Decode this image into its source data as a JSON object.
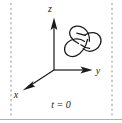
{
  "figure": {
    "kind": "3d-axes-with-knot-diagram",
    "background_color": "#ffffff",
    "stroke_color": "#1a1a1a",
    "dashed_color": "#8c8c8c",
    "baseline_color": "#b0b0b0",
    "axes": {
      "origin": {
        "x": 54,
        "y": 70
      },
      "z": {
        "label": "z",
        "label_pos": {
          "x": 50,
          "y": 12
        },
        "tip": {
          "x": 54,
          "y": 18
        }
      },
      "y": {
        "label": "y",
        "label_pos": {
          "x": 97,
          "y": 74
        },
        "tip": {
          "x": 92,
          "y": 70
        }
      },
      "x": {
        "label": "x",
        "label_pos": {
          "x": 15,
          "y": 97
        },
        "tip": {
          "x": 23,
          "y": 88
        }
      }
    },
    "knot": {
      "name": "trefoil-knot",
      "center": {
        "x": 82,
        "y": 42
      },
      "bbox": {
        "x": 64,
        "y": 24,
        "w": 38,
        "h": 38
      }
    },
    "dashed_lines": [
      {
        "name": "left-boundary",
        "x": 11,
        "y1": 3,
        "y2": 116
      },
      {
        "name": "right-boundary",
        "x": 112,
        "y1": 3,
        "y2": 116
      }
    ],
    "baseline": {
      "y": 119,
      "x1": 0,
      "x2": 122
    },
    "time_label": {
      "text": "t = 0",
      "pos": {
        "x": 46,
        "y": 108
      }
    }
  }
}
